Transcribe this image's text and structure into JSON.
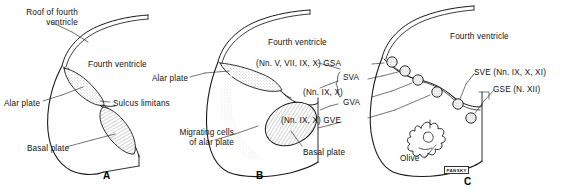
{
  "figure": {
    "signature": "PANSKY"
  },
  "panels": [
    {
      "id": "A",
      "letter": "A",
      "letter_pos": {
        "x": 103,
        "y": 172
      },
      "ventricle_label": "Fourth ventricle",
      "labels": [
        {
          "name": "roof-of-fourth-ventricle",
          "text": "Roof of fourth\nventricle",
          "x": 6,
          "y": 8,
          "align": "left"
        },
        {
          "name": "fourth-ventricle",
          "text": "Fourth ventricle",
          "x": 88,
          "y": 60,
          "align": "left"
        },
        {
          "name": "alar-plate",
          "text": "Alar plate",
          "x": 4,
          "y": 99,
          "align": "left"
        },
        {
          "name": "sulcus-limitans",
          "text": "Sulcus limitans",
          "x": 113,
          "y": 99,
          "align": "left"
        },
        {
          "name": "basal-plate",
          "text": "Basal plate",
          "x": 27,
          "y": 144,
          "align": "left"
        }
      ]
    },
    {
      "id": "B",
      "letter": "B",
      "letter_pos": {
        "x": 256,
        "y": 172
      },
      "ventricle_label": "Fourth ventricle",
      "labels": [
        {
          "name": "fourth-ventricle",
          "text": "Fourth ventricle",
          "x": 268,
          "y": 38,
          "align": "left"
        },
        {
          "name": "alar-plate",
          "text": "Alar plate",
          "x": 152,
          "y": 74,
          "align": "left"
        },
        {
          "name": "migrating-cells-of-alar-plate",
          "text": "Migrating cells\nof alar plate",
          "x": 168,
          "y": 128,
          "align": "left"
        },
        {
          "name": "basal-plate",
          "text": "Basal plate",
          "x": 303,
          "y": 148,
          "align": "left"
        },
        {
          "name": "gsa-nerves",
          "text": "(Nn. V, VII, IX, X) GSA",
          "x": 258,
          "y": 60,
          "align": "left"
        },
        {
          "name": "sva-gva-nerves",
          "text": "(Nn. IX, X)",
          "x": 307,
          "y": 89,
          "align": "left"
        },
        {
          "name": "sva",
          "text": "SVA",
          "x": 343,
          "y": 76,
          "align": "left"
        },
        {
          "name": "gva",
          "text": "GVA",
          "x": 343,
          "y": 99,
          "align": "left"
        },
        {
          "name": "gve-nerves",
          "text": "(Nn. IX, X) GVE",
          "x": 286,
          "y": 117,
          "align": "left"
        }
      ]
    },
    {
      "id": "C",
      "letter": "C",
      "letter_pos": {
        "x": 466,
        "y": 177
      },
      "ventricle_label": "Fourth ventricle",
      "labels": [
        {
          "name": "fourth-ventricle",
          "text": "Fourth ventricle",
          "x": 450,
          "y": 32,
          "align": "left"
        },
        {
          "name": "sve-nerves",
          "text": "SVE (Nn. IX, X, XI)",
          "x": 475,
          "y": 70,
          "align": "left"
        },
        {
          "name": "gse-nerve",
          "text": "GSE (N. XII)",
          "x": 495,
          "y": 87,
          "align": "left"
        },
        {
          "name": "olive",
          "text": "Olive",
          "x": 407,
          "y": 156,
          "align": "left"
        }
      ]
    }
  ],
  "nuclei_circles": [
    {
      "name": "gsa-nucleus",
      "cx": 392,
      "cy": 62
    },
    {
      "name": "sva-nucleus",
      "cx": 405,
      "cy": 71
    },
    {
      "name": "gva-nucleus",
      "cx": 418,
      "cy": 80
    },
    {
      "name": "gve-nucleus",
      "cx": 437,
      "cy": 92
    },
    {
      "name": "sve-nucleus",
      "cx": 458,
      "cy": 104
    },
    {
      "name": "gse-nucleus",
      "cx": 471,
      "cy": 118
    }
  ],
  "colors": {
    "ink": "#1a1a1a",
    "stipple": "#9a9a9a",
    "hatch": "#8a8a8a",
    "background": "#ffffff"
  }
}
